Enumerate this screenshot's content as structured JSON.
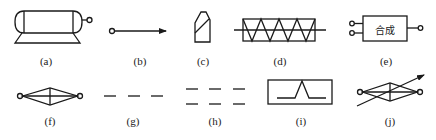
{
  "figure": {
    "symbols": [
      {
        "id": "a",
        "label": "(a)",
        "depicts": "tank-with-stand-and-outlet"
      },
      {
        "id": "b",
        "label": "(b)",
        "depicts": "line-with-circle-start-and-arrow"
      },
      {
        "id": "c",
        "label": "(c)",
        "depicts": "pencil-shaped-element"
      },
      {
        "id": "d",
        "label": "(d)",
        "depicts": "rectangle-with-zigzag-and-through-line"
      },
      {
        "id": "e",
        "label": "(e)",
        "depicts": "block-with-two-inputs-one-output",
        "box_text": "合成"
      },
      {
        "id": "f",
        "label": "(f)",
        "depicts": "diamond-with-end-terminals"
      },
      {
        "id": "g",
        "label": "(g)",
        "depicts": "single-dashed-line"
      },
      {
        "id": "h",
        "label": "(h)",
        "depicts": "double-dashed-line"
      },
      {
        "id": "i",
        "label": "(i)",
        "depicts": "box-with-peak-waveform"
      },
      {
        "id": "j",
        "label": "(j)",
        "depicts": "diamond-with-end-terminals-and-diagonal-arrow"
      }
    ]
  },
  "colors": {
    "line": "#1a1a1a",
    "background": "#ffffff"
  }
}
